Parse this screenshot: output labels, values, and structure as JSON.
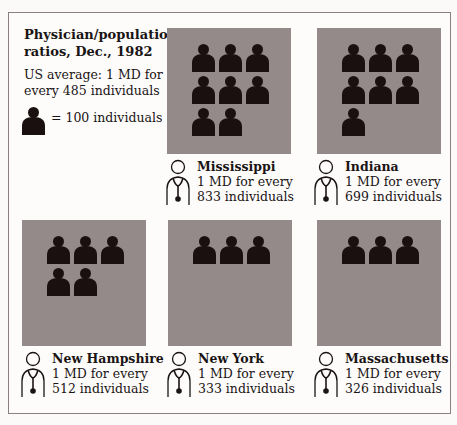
{
  "header": {
    "title": "Physician/population ratios, Dec., 1982",
    "us_average": "US average: 1 MD for every 485 individuals",
    "legend_label": "= 100 individuals"
  },
  "colors": {
    "panel_bg": "#948a8a",
    "icon": "#1a1010",
    "frame": "#8a8080"
  },
  "states": [
    {
      "name": "Mississippi",
      "line1": "1 MD for every",
      "line2": "833 individuals",
      "icons": 8
    },
    {
      "name": "Indiana",
      "line1": "1 MD for every",
      "line2": "699 individuals",
      "icons": 7
    },
    {
      "name": "New Hampshire",
      "line1": "1 MD for every",
      "line2": "512 individuals",
      "icons": 5
    },
    {
      "name": "New York",
      "line1": "1 MD for every",
      "line2": "333 individuals",
      "icons": 3
    },
    {
      "name": "Massachusetts",
      "line1": "1 MD for every",
      "line2": "326 individuals",
      "icons": 3
    }
  ],
  "chart_data": {
    "type": "bar",
    "title": "Physician/population ratios, Dec., 1982",
    "subtitle": "US average: 1 MD for every 485 individuals",
    "categories": [
      "Mississippi",
      "Indiana",
      "New Hampshire",
      "New York",
      "Massachusetts"
    ],
    "values": [
      833,
      699,
      512,
      333,
      326
    ],
    "icon_counts": [
      8,
      7,
      5,
      3,
      3
    ],
    "unit": "individuals per 1 MD",
    "legend": "1 person icon = 100 individuals",
    "reference_line": {
      "label": "US average",
      "value": 485
    },
    "xlabel": "",
    "ylabel": "Individuals per MD"
  }
}
